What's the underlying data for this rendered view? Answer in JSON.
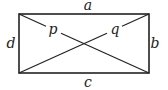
{
  "diagram": {
    "type": "rectangle-with-diagonals",
    "labels": {
      "top": "a",
      "right": "b",
      "bottom": "c",
      "left": "d",
      "diagonal_1": "p",
      "diagonal_2": "q"
    },
    "colors": {
      "stroke": "#222222",
      "background": "#ffffff"
    }
  }
}
